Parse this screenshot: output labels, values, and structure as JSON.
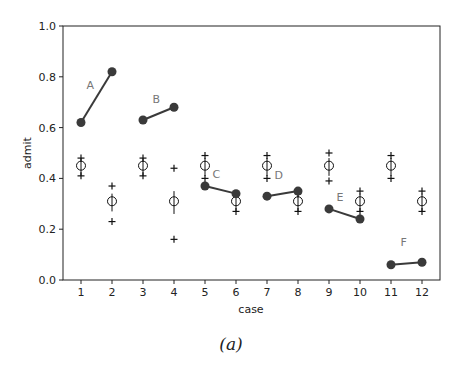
{
  "caption": "(a)",
  "chart_data": {
    "type": "scatter",
    "title": "",
    "xlabel": "case",
    "ylabel": "admit",
    "ylim": [
      0.0,
      1.0
    ],
    "xlim": [
      0.3,
      12.7
    ],
    "yticks": [
      0.0,
      0.2,
      0.4,
      0.6,
      0.8,
      1.0
    ],
    "ytick_labels": [
      "0.0",
      "0.2",
      "0.4",
      "0.6",
      "0.8",
      "1.0"
    ],
    "xticks": [
      1,
      2,
      3,
      4,
      5,
      6,
      7,
      8,
      9,
      10,
      11,
      12
    ],
    "xtick_labels": [
      "1",
      "2",
      "3",
      "4",
      "5",
      "6",
      "7",
      "8",
      "9",
      "10",
      "11",
      "12"
    ],
    "grid": false,
    "observed_pairs": [
      {
        "label": "A",
        "cases": [
          1,
          2
        ],
        "values": [
          0.62,
          0.82
        ]
      },
      {
        "label": "B",
        "cases": [
          3,
          4
        ],
        "values": [
          0.63,
          0.68
        ]
      },
      {
        "label": "C",
        "cases": [
          5,
          6
        ],
        "values": [
          0.37,
          0.34
        ]
      },
      {
        "label": "D",
        "cases": [
          7,
          8
        ],
        "values": [
          0.33,
          0.35
        ]
      },
      {
        "label": "E",
        "cases": [
          9,
          10
        ],
        "values": [
          0.28,
          0.24
        ]
      },
      {
        "label": "F",
        "cases": [
          11,
          12
        ],
        "values": [
          0.06,
          0.07
        ]
      }
    ],
    "predicted": {
      "x": [
        1,
        2,
        3,
        4,
        5,
        6,
        7,
        8,
        9,
        10,
        11,
        12
      ],
      "mean": [
        0.45,
        0.31,
        0.45,
        0.31,
        0.45,
        0.31,
        0.45,
        0.31,
        0.45,
        0.31,
        0.45,
        0.31
      ],
      "interval_low": [
        0.41,
        0.27,
        0.41,
        0.26,
        0.41,
        0.27,
        0.41,
        0.27,
        0.41,
        0.27,
        0.41,
        0.27
      ],
      "interval_high": [
        0.48,
        0.34,
        0.48,
        0.35,
        0.48,
        0.34,
        0.48,
        0.34,
        0.48,
        0.34,
        0.48,
        0.34
      ],
      "plus_low": [
        0.41,
        0.23,
        0.41,
        0.16,
        0.4,
        0.27,
        0.4,
        0.27,
        0.39,
        0.27,
        0.4,
        0.27
      ],
      "plus_high": [
        0.48,
        0.37,
        0.48,
        0.44,
        0.49,
        0.34,
        0.49,
        0.34,
        0.5,
        0.35,
        0.49,
        0.35
      ]
    },
    "colors": {
      "observed": "#3a3a3a",
      "predicted": "#111111",
      "pair_label": "#777777"
    }
  }
}
